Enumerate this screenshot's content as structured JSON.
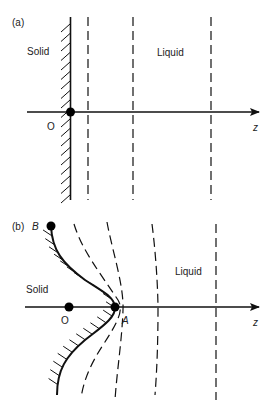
{
  "panels": [
    {
      "id": "a",
      "panel_label": "(a)",
      "solid_label": "Solid",
      "liquid_label": "Liquid",
      "origin_label": "O",
      "axis_label": "z",
      "interface_shape": "planar",
      "isotherm_count": 3
    },
    {
      "id": "b",
      "panel_label": "(b)",
      "point_b_label": "B",
      "solid_label": "Solid",
      "liquid_label": "Liquid",
      "origin_label": "O",
      "point_a_label": "A",
      "axis_label": "z",
      "interface_shape": "perturbed",
      "isotherm_count": 3
    }
  ]
}
